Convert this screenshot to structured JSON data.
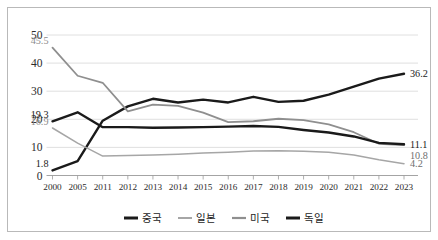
{
  "chart_data": {
    "type": "line",
    "title": "",
    "subtitle": "",
    "xlabel": "",
    "ylabel": "",
    "categories": [
      "2000",
      "2005",
      "2011",
      "2012",
      "2013",
      "2014",
      "2015",
      "2016",
      "2017",
      "2018",
      "2019",
      "2020",
      "2021",
      "2022",
      "2023"
    ],
    "ylim": [
      0,
      50
    ],
    "yticks": [
      0,
      10,
      20,
      30,
      40,
      50
    ],
    "ytick_labels": [
      "0",
      "10",
      "20",
      "30",
      "40",
      "50"
    ],
    "grid": true,
    "legend_position": "bottom",
    "series": [
      {
        "name": "중국",
        "color": "#1a1a1a",
        "width": 2.4,
        "values": [
          1.8,
          5.1,
          19.5,
          24.6,
          27.3,
          26.0,
          27.0,
          26.0,
          28.0,
          26.2,
          26.6,
          28.8,
          31.6,
          34.5,
          36.2
        ]
      },
      {
        "name": "일본",
        "color": "#a6a6a6",
        "width": 1.5,
        "values": [
          16.9,
          11.5,
          6.9,
          7.1,
          7.3,
          7.6,
          8.0,
          8.3,
          8.7,
          8.8,
          8.6,
          8.3,
          7.3,
          5.6,
          4.2
        ]
      },
      {
        "name": "미국",
        "color": "#8f8f8f",
        "width": 1.8,
        "values": [
          45.5,
          35.5,
          33.0,
          22.8,
          25.2,
          24.8,
          22.4,
          19.0,
          19.3,
          20.2,
          19.7,
          18.2,
          15.4,
          11.3,
          10.8
        ]
      },
      {
        "name": "독일",
        "color": "#1a1a1a",
        "width": 2.4,
        "values": [
          19.3,
          22.5,
          17.2,
          17.2,
          17.0,
          17.1,
          17.2,
          17.4,
          17.6,
          17.3,
          16.2,
          15.3,
          13.9,
          11.6,
          11.1
        ]
      }
    ],
    "start_labels": [
      {
        "text": "45.5",
        "series": "미국",
        "style": "grey"
      },
      {
        "text": "19.3",
        "series": "독일",
        "style": "dark"
      },
      {
        "text": "16.9",
        "series": "일본",
        "style": "grey"
      },
      {
        "text": "1.8",
        "series": "중국",
        "style": "dark"
      }
    ],
    "end_labels": [
      {
        "text": "36.2",
        "series": "중국",
        "style": "dark"
      },
      {
        "text": "11.1",
        "series": "독일",
        "style": "dark"
      },
      {
        "text": "10.8",
        "series": "미국",
        "style": "midgrey"
      },
      {
        "text": "4.2",
        "series": "일본",
        "style": "midgrey"
      }
    ]
  },
  "legend": {
    "items": [
      {
        "label": "중국",
        "color": "#1a1a1a",
        "width": 3.0
      },
      {
        "label": "일본",
        "color": "#a6a6a6",
        "width": 2.0
      },
      {
        "label": "미국",
        "color": "#8f8f8f",
        "width": 2.2
      },
      {
        "label": "독일",
        "color": "#1a1a1a",
        "width": 3.0
      }
    ]
  }
}
